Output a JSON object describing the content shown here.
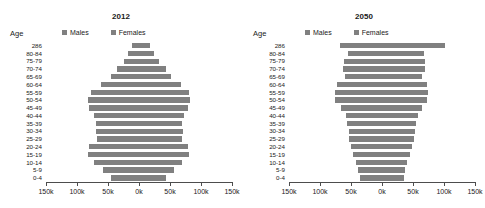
{
  "chart_data": [
    {
      "type": "bar",
      "title": "2012",
      "xlabel": "",
      "ylabel": "Age",
      "axis_label": "Age",
      "legend": [
        "Males",
        "Females"
      ],
      "legend_position": "top",
      "grid": false,
      "xlim": [
        -150000,
        150000
      ],
      "xticks": [
        -150000,
        -100000,
        -50000,
        0,
        50000,
        100000,
        150000
      ],
      "xticklabels": [
        "150k",
        "100k",
        "50k",
        "0k",
        "50k",
        "100k",
        "150k"
      ],
      "categories": [
        "286",
        "80-84",
        "75-79",
        "70-74",
        "65-69",
        "60-64",
        "55-59",
        "50-54",
        "45-49",
        "40-44",
        "35-39",
        "30-34",
        "25-29",
        "20-24",
        "15-19",
        "10-14",
        "5-9",
        "0-4"
      ],
      "series": [
        {
          "name": "Males",
          "values": [
            12000,
            17000,
            25000,
            35000,
            45000,
            62000,
            78000,
            82000,
            80000,
            72000,
            70000,
            70000,
            68000,
            80000,
            82000,
            72000,
            58000,
            45000
          ]
        },
        {
          "name": "Females",
          "values": [
            18000,
            24000,
            33000,
            43000,
            52000,
            68000,
            80000,
            82000,
            79000,
            72000,
            70000,
            71000,
            69000,
            79000,
            80000,
            70000,
            56000,
            43000
          ]
        }
      ]
    },
    {
      "type": "bar",
      "title": "2050",
      "xlabel": "",
      "ylabel": "Age",
      "axis_label": "Age",
      "legend": [
        "Males",
        "Females"
      ],
      "legend_position": "top",
      "grid": false,
      "xlim": [
        -150000,
        150000
      ],
      "xticks": [
        -150000,
        -100000,
        -50000,
        0,
        50000,
        100000,
        150000
      ],
      "xticklabels": [
        "150k",
        "100k",
        "50k",
        "0k",
        "50k",
        "100k",
        "150k"
      ],
      "categories": [
        "286",
        "80-84",
        "75-79",
        "70-74",
        "65-69",
        "60-64",
        "55-59",
        "50-54",
        "45-49",
        "40-44",
        "35-39",
        "30-34",
        "25-29",
        "20-24",
        "15-19",
        "10-14",
        "5-9",
        "0-4"
      ],
      "series": [
        {
          "name": "Males",
          "values": [
            68000,
            55000,
            62000,
            63000,
            60000,
            72000,
            76000,
            76000,
            66000,
            58000,
            56000,
            54000,
            53000,
            50000,
            46000,
            42000,
            38000,
            36000
          ]
        },
        {
          "name": "Females",
          "values": [
            102000,
            68000,
            70000,
            69000,
            65000,
            72000,
            74000,
            73000,
            65000,
            58000,
            55000,
            53000,
            52000,
            49000,
            45000,
            41000,
            37000,
            35000
          ]
        }
      ]
    }
  ],
  "panels": [
    {
      "title": "2012",
      "axis_label": "Age",
      "legend": [
        {
          "label": "Males",
          "color": "#808080"
        },
        {
          "label": "Females",
          "color": "#808080"
        }
      ],
      "xticklabels": [
        "150k",
        "100k",
        "50k",
        "0k",
        "50k",
        "100k",
        "150k"
      ]
    },
    {
      "title": "2050",
      "axis_label": "Age",
      "legend": [
        {
          "label": "Males",
          "color": "#808080"
        },
        {
          "label": "Females",
          "color": "#808080"
        }
      ],
      "xticklabels": [
        "150k",
        "100k",
        "50k",
        "0k",
        "50k",
        "100k",
        "150k"
      ]
    }
  ],
  "style": {
    "bar_color": "#808080",
    "axis_color": "#4d4d4d",
    "text_color": "#1a1a1a",
    "background": "#ffffff"
  }
}
